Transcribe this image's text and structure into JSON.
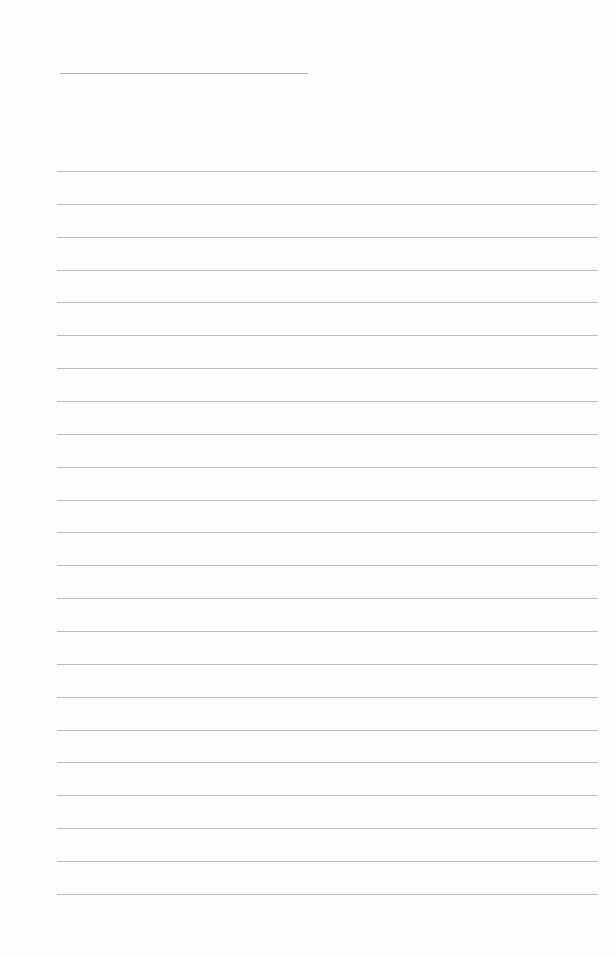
{
  "page": {
    "type": "lined-paper",
    "background": "#fefefe",
    "line_color": "#bdbdbd",
    "title_line": {
      "x": 60,
      "y": 73,
      "width": 248
    },
    "rules": {
      "count": 23,
      "x": 57,
      "width": 541,
      "first_y": 171,
      "spacing": 32.86
    }
  }
}
